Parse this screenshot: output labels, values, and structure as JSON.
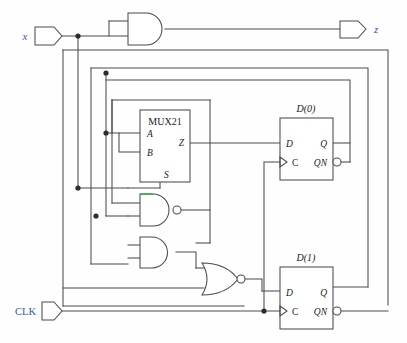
{
  "diagram": {
    "colors": {
      "wire": "#4a4a52",
      "gate_outline": "#4a4a52",
      "label_blue": "#3457a6",
      "label_black": "#1a1a1a",
      "highlight_green": "#3faa4a",
      "background": "#fefefe"
    }
  },
  "ports": {
    "inputs": [
      {
        "name": "x-input-port",
        "label": "x",
        "color": "#3457a6"
      },
      {
        "name": "clk-input-port",
        "label": "CLK",
        "color": "#3457a6"
      }
    ],
    "outputs": [
      {
        "name": "z-output-port",
        "label": "z",
        "color": "#3457a6"
      }
    ]
  },
  "blocks": [
    {
      "name": "mux21-block",
      "label": "MUX21",
      "pins": {
        "a": "A",
        "b": "B",
        "s": "S",
        "z": "Z"
      }
    },
    {
      "name": "dff0-block",
      "label": "D(0)",
      "pins": {
        "d": "D",
        "c": "C",
        "q": "Q",
        "qn": "QN"
      }
    },
    {
      "name": "dff1-block",
      "label": "D(1)",
      "pins": {
        "d": "D",
        "c": "C",
        "q": "Q",
        "qn": "QN"
      }
    }
  ],
  "gates": [
    {
      "name": "and-gate-top",
      "type": "AND",
      "inverted_output": false,
      "inputs": 2,
      "highlighted": false
    },
    {
      "name": "nand-gate-mid",
      "type": "NAND",
      "inverted_output": true,
      "inputs": 2,
      "highlighted": true
    },
    {
      "name": "and-gate-lower",
      "type": "AND",
      "inverted_output": false,
      "inputs": 2,
      "highlighted": false
    },
    {
      "name": "nor-gate-bottom",
      "type": "NOR",
      "inverted_output": true,
      "inputs": 2,
      "highlighted": false
    }
  ],
  "junction_dots": [
    {
      "name": "junction-x-fanout",
      "x": 78,
      "y": 36
    },
    {
      "name": "junction-bus-upper",
      "x": 106,
      "y": 73
    },
    {
      "name": "junction-mux-a",
      "x": 106,
      "y": 133
    },
    {
      "name": "junction-mux-s-bus",
      "x": 78,
      "y": 188
    },
    {
      "name": "junction-nand-input",
      "x": 96,
      "y": 216
    },
    {
      "name": "junction-clk-fanout",
      "x": 264,
      "y": 311
    }
  ]
}
